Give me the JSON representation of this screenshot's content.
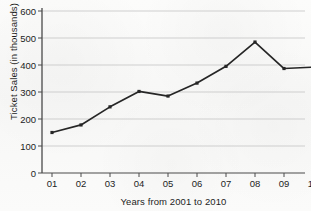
{
  "chart_data": {
    "type": "line",
    "title": "",
    "xlabel": "Years from 2001 to 2010",
    "ylabel": "Ticket Sales (in thousands)",
    "categories": [
      "01",
      "02",
      "03",
      "04",
      "05",
      "06",
      "07",
      "08",
      "09",
      "10"
    ],
    "values": [
      150,
      178,
      245,
      302,
      285,
      333,
      395,
      485,
      387,
      392
    ],
    "ylim": [
      0,
      600
    ],
    "ytick_labels": [
      "0",
      "100",
      "200",
      "300",
      "400",
      "500",
      "600"
    ],
    "ytick_values": [
      0,
      100,
      200,
      300,
      400,
      500,
      600
    ],
    "grid": "horizontal",
    "legend": "none",
    "series_color": "#262626",
    "grid_color": "#c9c9c9",
    "axis_color": "#4a4a4a",
    "marker": "square"
  }
}
